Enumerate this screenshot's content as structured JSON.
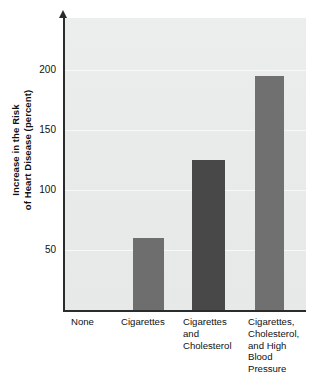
{
  "chart_data": {
    "type": "bar",
    "title": "",
    "subtitle": "",
    "xlabel": "",
    "ylabel": "Increase in the Risk\nof Heart Disease (percent)",
    "categories": [
      "None",
      "Cigarettes",
      "Cigarettes\nand\nCholesterol",
      "Cigarettes,\nCholesterol,\nand High\nBlood\nPressure"
    ],
    "values": [
      0,
      60,
      125,
      195
    ],
    "ylim": [
      0,
      243
    ],
    "yticks": [
      50,
      100,
      150,
      200
    ],
    "ytick_labels": [
      "50",
      "100",
      "150",
      "200"
    ],
    "grid": true,
    "legend": "none",
    "bar_colors": [
      "#e8e9e9",
      "#6e6e6e",
      "#484848",
      "#707070"
    ],
    "plot_background": "#eaebeb",
    "axis_color": "#2b2b2b",
    "gridline_color": "#f7f8f8"
  },
  "figure": {
    "background": "#ffffff",
    "yaxis_has_arrow": true
  }
}
